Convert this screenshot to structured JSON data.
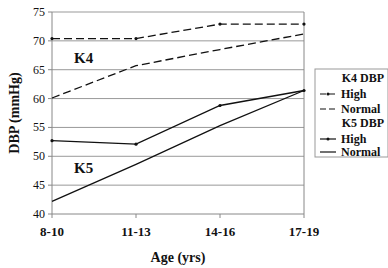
{
  "chart_data": {
    "type": "line",
    "title": "",
    "xlabel": "Age (yrs)",
    "ylabel": "DBP (mmHg)",
    "categories": [
      "8-10",
      "11-13",
      "14-16",
      "17-19"
    ],
    "ylim": [
      40,
      75
    ],
    "yticks": [
      40,
      45,
      50,
      55,
      60,
      65,
      70,
      75
    ],
    "grid": true,
    "legend_position": "right",
    "annotations": [
      "K4",
      "K5"
    ],
    "series": [
      {
        "name": "K4 DBP High",
        "group": "K4 DBP",
        "label": "High",
        "style": "dashed-marker",
        "values": [
          70.4,
          70.4,
          72.9,
          72.9
        ]
      },
      {
        "name": "K4 DBP Normal",
        "group": "K4 DBP",
        "label": "Normal",
        "style": "dashed",
        "values": [
          60.1,
          65.7,
          68.5,
          71.2
        ]
      },
      {
        "name": "K5 DBP High",
        "group": "K5 DBP",
        "label": "High",
        "style": "solid-marker",
        "values": [
          52.7,
          52.1,
          58.8,
          61.4
        ]
      },
      {
        "name": "K5 DBP Normal",
        "group": "K5 DBP",
        "label": "Normal",
        "style": "solid",
        "values": [
          42.2,
          48.6,
          55.3,
          61.4
        ]
      }
    ]
  },
  "legend": {
    "k4_title": "K4 DBP",
    "k4_high": "High",
    "k4_normal": "Normal",
    "k5_title": "K5 DBP",
    "k5_high": "High",
    "k5_normal": "Normal"
  },
  "labels": {
    "k4": "K4",
    "k5": "K5"
  }
}
